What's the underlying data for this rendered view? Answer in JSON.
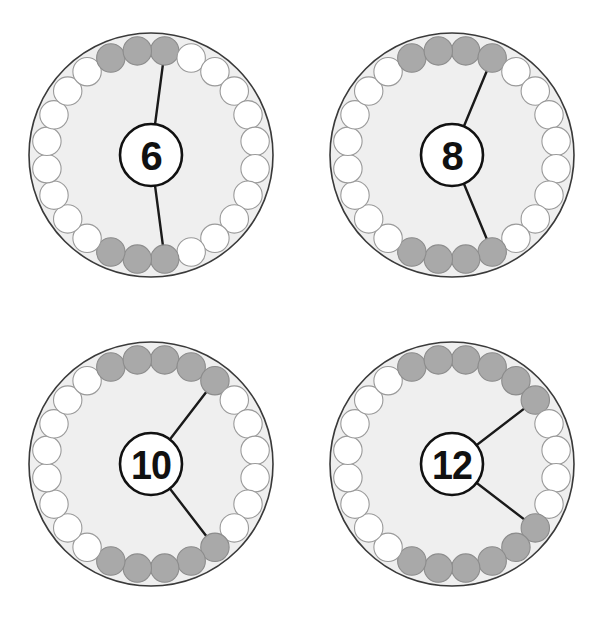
{
  "figure": {
    "title": "",
    "background_color": "#ffffff",
    "wheel_count": 4,
    "columns": 2,
    "rows": 2
  },
  "style": {
    "disc_fill": "#efefef",
    "disc_stroke": "#3a3a3a",
    "bead_empty_fill": "#ffffff",
    "bead_filled_fill": "#a9a9a9",
    "bead_stroke": "#9a9a9a",
    "bead_filled_stroke": "#8c8c8c",
    "spoke_color": "#1a1a1a",
    "label_fill": "#ffffff",
    "label_stroke": "#111111",
    "number_color": "#111111"
  },
  "chart_data": {
    "type": "pie",
    "title": "",
    "subtitle": "",
    "xlabel": "",
    "ylabel": "",
    "legend": [],
    "categories": [
      "6",
      "8",
      "10",
      "12"
    ],
    "values": [
      6,
      8,
      10,
      12
    ],
    "series": [
      {
        "name": "shaded beads total",
        "values": [
          6,
          8,
          10,
          12
        ]
      },
      {
        "name": "beads per arc",
        "values": [
          3,
          4,
          5,
          6
        ]
      },
      {
        "name": "unshaded beads",
        "values": [
          18,
          16,
          14,
          12
        ]
      },
      {
        "name": "beads in ring",
        "values": [
          24,
          24,
          24,
          24
        ]
      }
    ]
  },
  "wheels": [
    {
      "id": "wheel-6",
      "number": "6",
      "bead_total": 24,
      "shaded_total": 6,
      "arc_size": 3,
      "arcs": [
        {
          "name": "arc-top",
          "start_index": 22,
          "count": 3
        },
        {
          "name": "arc-bottom",
          "start_index": 11,
          "count": 3
        }
      ],
      "shaded_indices": [
        22,
        23,
        0,
        11,
        12,
        13
      ],
      "spokes": [
        {
          "name": "spoke-upper",
          "bead_index": 0
        },
        {
          "name": "spoke-lower",
          "bead_index": 11
        }
      ]
    },
    {
      "id": "wheel-8",
      "number": "8",
      "bead_total": 24,
      "shaded_total": 8,
      "arc_size": 4,
      "arcs": [
        {
          "name": "arc-top",
          "start_index": 22,
          "count": 4
        },
        {
          "name": "arc-bottom",
          "start_index": 10,
          "count": 4
        }
      ],
      "shaded_indices": [
        22,
        23,
        0,
        1,
        10,
        11,
        12,
        13
      ],
      "spokes": [
        {
          "name": "spoke-upper",
          "bead_index": 1
        },
        {
          "name": "spoke-lower",
          "bead_index": 10
        }
      ]
    },
    {
      "id": "wheel-10",
      "number": "10",
      "bead_total": 24,
      "shaded_total": 10,
      "arc_size": 5,
      "arcs": [
        {
          "name": "arc-top",
          "start_index": 22,
          "count": 5
        },
        {
          "name": "arc-bottom",
          "start_index": 9,
          "count": 5
        }
      ],
      "shaded_indices": [
        22,
        23,
        0,
        1,
        2,
        9,
        10,
        11,
        12,
        13
      ],
      "spokes": [
        {
          "name": "spoke-upper",
          "bead_index": 2
        },
        {
          "name": "spoke-lower",
          "bead_index": 9
        }
      ]
    },
    {
      "id": "wheel-12",
      "number": "12",
      "bead_total": 24,
      "shaded_total": 12,
      "arc_size": 6,
      "arcs": [
        {
          "name": "arc-top",
          "start_index": 22,
          "count": 6
        },
        {
          "name": "arc-bottom",
          "start_index": 8,
          "count": 6
        }
      ],
      "shaded_indices": [
        22,
        23,
        0,
        1,
        2,
        3,
        8,
        9,
        10,
        11,
        12,
        13
      ],
      "spokes": [
        {
          "name": "spoke-upper",
          "bead_index": 3
        },
        {
          "name": "spoke-lower",
          "bead_index": 8
        }
      ]
    }
  ]
}
